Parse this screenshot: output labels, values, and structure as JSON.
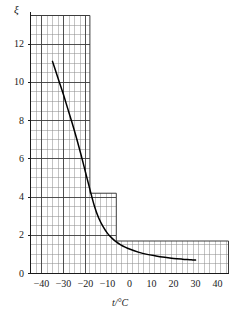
{
  "chart_data": {
    "type": "line",
    "title": "",
    "subtitle": "",
    "xlabel": "t/°C",
    "ylabel": "ξ",
    "xlim": [
      -45,
      45
    ],
    "ylim": [
      0,
      13.5
    ],
    "grid": true,
    "legend": null,
    "x_ticks": [
      -40,
      -30,
      -20,
      -10,
      0,
      10,
      20,
      30,
      40
    ],
    "x_tick_labels": [
      "−40",
      "−30",
      "−20",
      "−10",
      "0",
      "10",
      "20",
      "30",
      "40"
    ],
    "y_ticks": [
      0,
      2,
      4,
      6,
      8,
      10,
      12
    ],
    "y_tick_labels": [
      "0",
      "2",
      "4",
      "6",
      "8",
      "10",
      "12"
    ],
    "x_minor_step": 2.5,
    "y_minor_step": 0.5,
    "x_major_step": 10,
    "y_major_step": 2,
    "grid_regions": [
      {
        "name": "tall-region",
        "x_from": -45,
        "x_to": -18,
        "y_top": 13.5
      },
      {
        "name": "mid-region",
        "x_from": -18,
        "x_to": -6,
        "y_top": 4.2
      },
      {
        "name": "low-region",
        "x_from": -6,
        "x_to": 45,
        "y_top": 1.7
      }
    ],
    "series": [
      {
        "name": "ξ(t)",
        "color": "#000000",
        "x": [
          -35,
          -34,
          -32,
          -30,
          -28,
          -26,
          -24,
          -22,
          -20,
          -18,
          -16,
          -14,
          -12,
          -10,
          -8,
          -6,
          -4,
          -2,
          0,
          4,
          8,
          12,
          16,
          20,
          24,
          28,
          30
        ],
        "values": [
          11.1,
          10.75,
          10.05,
          9.35,
          8.6,
          7.85,
          7.05,
          6.2,
          5.3,
          4.4,
          3.55,
          2.9,
          2.45,
          2.1,
          1.85,
          1.65,
          1.5,
          1.38,
          1.28,
          1.12,
          1.0,
          0.92,
          0.85,
          0.79,
          0.75,
          0.72,
          0.7
        ]
      }
    ]
  },
  "axis": {
    "y_symbol": "ξ",
    "x_name": "t/°C"
  },
  "colors": {
    "curve": "#000000",
    "grid_minor": "#8a8a8a",
    "grid_major": "#3c3c3c",
    "text": "#1a1a1a",
    "background": "#ffffff"
  }
}
